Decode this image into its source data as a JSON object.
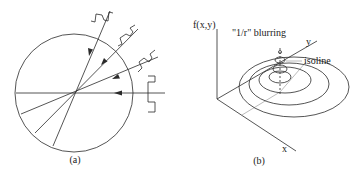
{
  "panel_a": {
    "caption": "(a)"
  },
  "panel_b": {
    "caption": "(b)",
    "axis_z_label": "f(x,y)",
    "axis_y_label": "y",
    "axis_x_label": "x",
    "blur_label": "\"1/r\" blurring",
    "isoline_label": "isoline"
  },
  "colors": {
    "line": "#2a2a2a",
    "faint": "#aaaaaa",
    "background": "#ffffff"
  }
}
